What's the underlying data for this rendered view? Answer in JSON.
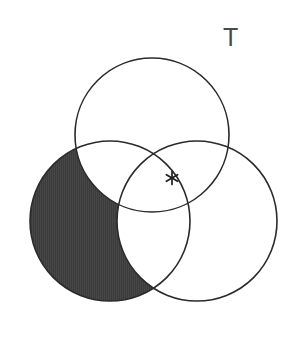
{
  "figure": {
    "title": "",
    "canvas": {
      "width": 306,
      "height": 364,
      "background": "#ffffff"
    }
  },
  "labels": [
    {
      "id": "T",
      "text": "T",
      "x": 232,
      "y": 39,
      "color": "#4a4a4a"
    }
  ],
  "markers": [
    {
      "id": "asterisk",
      "glyph": "*",
      "x": 172,
      "y": 178,
      "color": "#1f1f1f",
      "region": "top-right-overlap"
    }
  ],
  "circles": [
    {
      "id": "top",
      "name": "top-circle",
      "cx": 152,
      "cy": 135,
      "r": 77,
      "stroke": "#2b2b2b",
      "stroke_width": 1.6,
      "fill": "none"
    },
    {
      "id": "left",
      "name": "left-circle",
      "cx": 110,
      "cy": 221,
      "r": 80,
      "stroke": "#2b2b2b",
      "stroke_width": 1.6,
      "fill": "none"
    },
    {
      "id": "right",
      "name": "right-circle",
      "cx": 197,
      "cy": 221,
      "r": 80,
      "stroke": "#2b2b2b",
      "stroke_width": 1.6,
      "fill": "none"
    }
  ],
  "shading": {
    "region_description": "left circle only (excluding top and right circles)",
    "base_circle": "left",
    "subtract_circles": [
      "top",
      "right"
    ],
    "fill_color": "#3d3d3d",
    "texture": "fine vertical striations",
    "texture_color": "#4a4a4a"
  },
  "chart_data": {
    "type": "venn",
    "title": "",
    "sets": [
      "top",
      "left",
      "right"
    ],
    "set_labels": [
      "",
      "",
      ""
    ],
    "shaded_regions": [
      "left_only"
    ],
    "unshaded_regions": [
      "top_only",
      "right_only",
      "top_left",
      "top_right",
      "left_right",
      "top_left_right",
      "outside"
    ],
    "annotations": [
      {
        "label": "T",
        "x": 232,
        "y": 39,
        "kind": "figure-label"
      },
      {
        "label": "*",
        "x": 172,
        "y": 178,
        "kind": "point-marker",
        "located_in": "top_right"
      }
    ],
    "grid": false,
    "legend": false
  }
}
